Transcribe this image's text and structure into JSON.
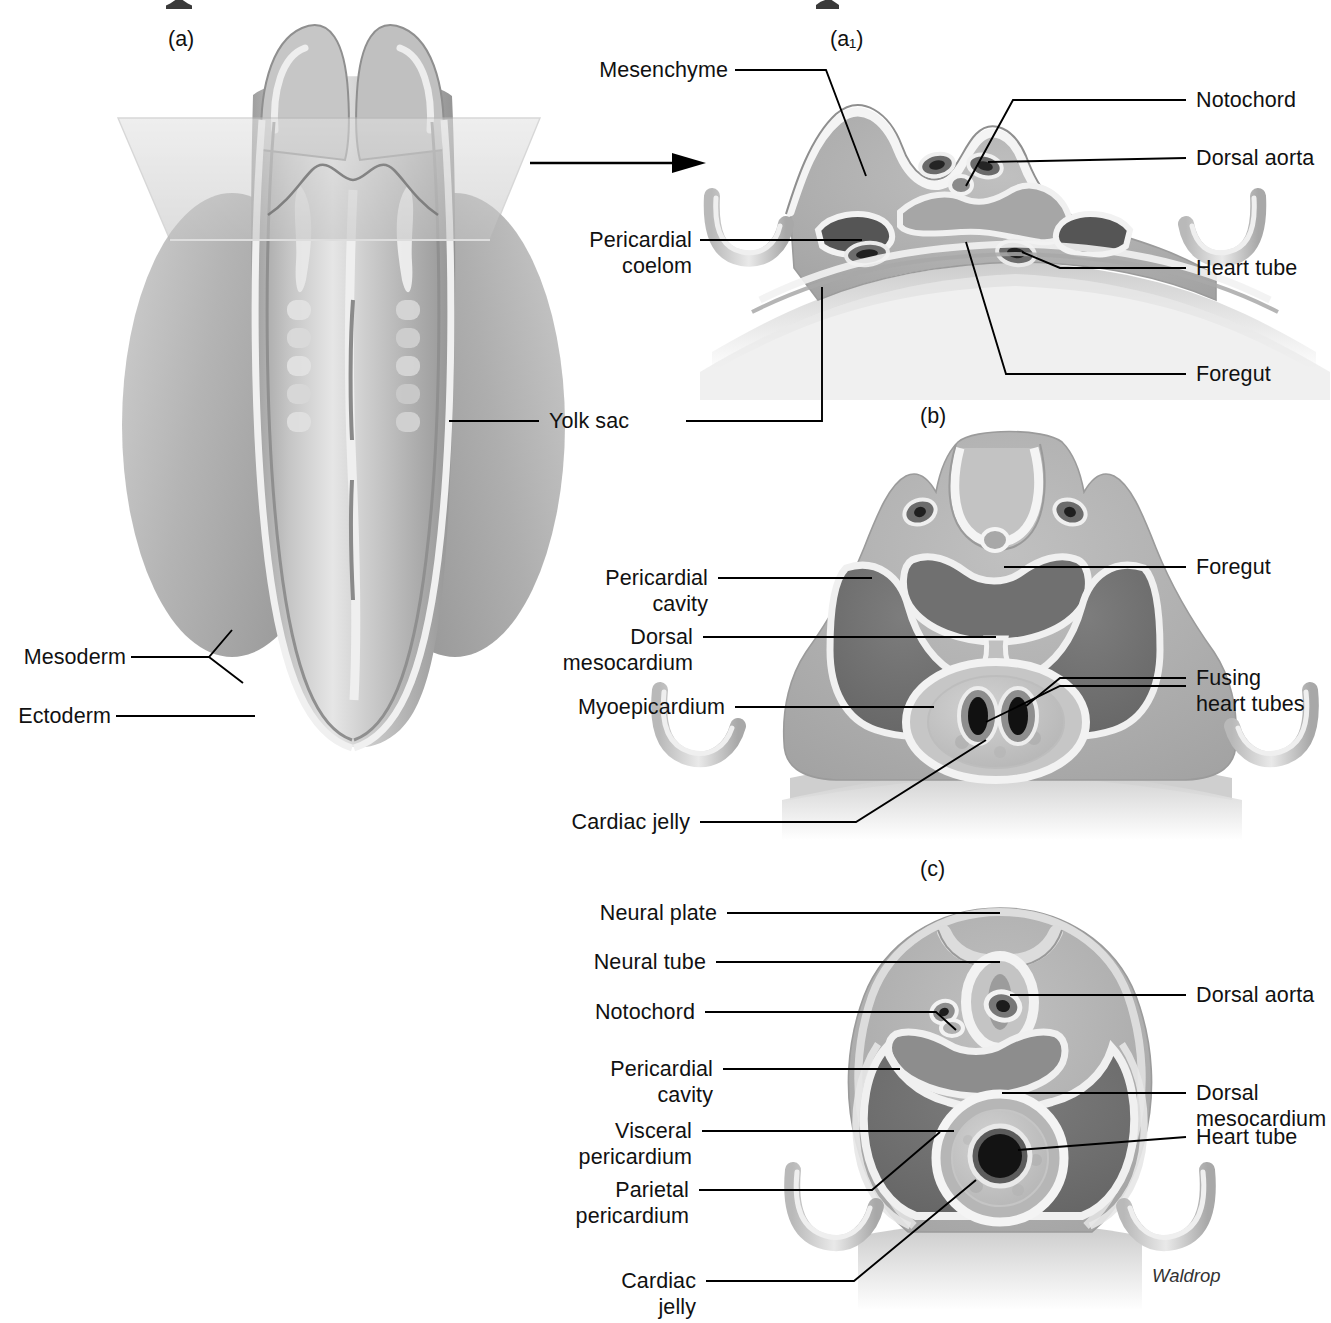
{
  "figure": {
    "title_fragment_visible": false,
    "signature": "Waldrop",
    "panels": [
      {
        "id": "a",
        "label": "(a)"
      },
      {
        "id": "a1",
        "label": "(a₁)"
      },
      {
        "id": "b",
        "label": "(b)"
      },
      {
        "id": "c",
        "label": "(c)"
      }
    ]
  },
  "colors": {
    "ink": "#111111",
    "leader": "#000000",
    "paper": "#ffffff",
    "tissue_light": "#d7d7d7",
    "tissue_mid": "#b0b0b0",
    "tissue_dark": "#8d8d8d",
    "cavity": "#6e6e6e",
    "lumen_dark": "#2a2a2a",
    "highlight": "#f2f2f2",
    "plane": "#cfcfcf"
  },
  "panel_a": {
    "id_label": "(a)",
    "labels": [
      {
        "name": "mesoderm",
        "text": "Mesoderm"
      },
      {
        "name": "ectoderm",
        "text": "Ectoderm"
      },
      {
        "name": "yolk-sac",
        "text": "Yolk sac"
      }
    ]
  },
  "panel_a1": {
    "id_label": "(a₁)",
    "labels_left": [
      {
        "name": "mesenchyme",
        "text": "Mesenchyme"
      },
      {
        "name": "pericardial-coelom",
        "text": "Pericardial\ncoelom"
      },
      {
        "name": "yolk-sac",
        "text": "Yolk sac"
      }
    ],
    "labels_right": [
      {
        "name": "notochord",
        "text": "Notochord"
      },
      {
        "name": "dorsal-aorta",
        "text": "Dorsal aorta"
      },
      {
        "name": "heart-tube",
        "text": "Heart tube"
      },
      {
        "name": "foregut",
        "text": "Foregut"
      }
    ]
  },
  "panel_b": {
    "id_label": "(b)",
    "labels_left": [
      {
        "name": "pericardial-cavity",
        "text": "Pericardial\ncavity"
      },
      {
        "name": "dorsal-mesocardium",
        "text": "Dorsal\nmesocardium"
      },
      {
        "name": "myoepicardium",
        "text": "Myoepicardium"
      },
      {
        "name": "cardiac-jelly",
        "text": "Cardiac jelly"
      }
    ],
    "labels_right": [
      {
        "name": "foregut",
        "text": "Foregut"
      },
      {
        "name": "fusing-heart-tubes",
        "text": "Fusing\nheart tubes"
      }
    ]
  },
  "panel_c": {
    "id_label": "(c)",
    "labels_left": [
      {
        "name": "neural-plate",
        "text": "Neural plate"
      },
      {
        "name": "neural-tube",
        "text": "Neural tube"
      },
      {
        "name": "notochord",
        "text": "Notochord"
      },
      {
        "name": "pericardial-cavity",
        "text": "Pericardial\ncavity"
      },
      {
        "name": "visceral-pericardium",
        "text": "Visceral\npericardium"
      },
      {
        "name": "parietal-pericardium",
        "text": "Parietal\npericardium"
      },
      {
        "name": "cardiac-jelly",
        "text": "Cardiac\njelly"
      }
    ],
    "labels_right": [
      {
        "name": "dorsal-aorta",
        "text": "Dorsal aorta"
      },
      {
        "name": "dorsal-mesocardium",
        "text": "Dorsal\nmesocardium"
      },
      {
        "name": "heart-tube",
        "text": "Heart tube"
      }
    ]
  }
}
